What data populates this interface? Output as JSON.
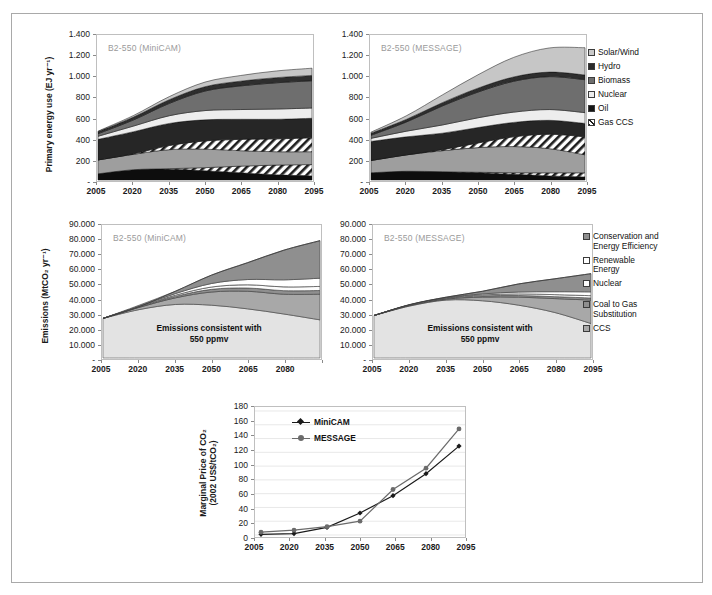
{
  "figure": {
    "panels": [
      {
        "id": "top-left",
        "tag": "B2-550 (MiniCAM)"
      },
      {
        "id": "top-right",
        "tag": "B2-550 (MESSAGE)"
      },
      {
        "id": "mid-left",
        "tag": "B2-550 (MiniCAM)"
      },
      {
        "id": "mid-right",
        "tag": "B2-550 (MESSAGE)"
      },
      {
        "id": "bottom",
        "tag": ""
      }
    ]
  },
  "energy_legend": {
    "items": [
      {
        "label": "Solar/Wind",
        "color": "#c9c9c9",
        "pattern": "solid"
      },
      {
        "label": "Hydro",
        "color": "#2b2b2b",
        "pattern": "solid"
      },
      {
        "label": "Biomass",
        "color": "#6e6e6e",
        "pattern": "solid"
      },
      {
        "label": "Nuclear",
        "color": "#ededed",
        "pattern": "solid"
      },
      {
        "label": "Oil",
        "color": "#151515",
        "pattern": "solid"
      },
      {
        "label": "Gas CCS",
        "color": "#ffffff",
        "pattern": "hatch"
      },
      {
        "label": "Coal CCS",
        "color": "#ffffff",
        "pattern": "hatch"
      }
    ]
  },
  "emissions_legend": {
    "items": [
      {
        "label": "Conservation and\nEnergy Efficiency",
        "color": "#8f8f8f",
        "pattern": "solid"
      },
      {
        "label": "Renewable\nEnergy",
        "color": "#ffffff",
        "pattern": "solid"
      },
      {
        "label": "Nuclear",
        "color": "#fcfcfc",
        "pattern": "solid"
      },
      {
        "label": "Coal to Gas\nSubstitution",
        "color": "#8f8f8f",
        "pattern": "solid"
      },
      {
        "label": "CCS",
        "color": "#a8a8a8",
        "pattern": "solid"
      }
    ]
  },
  "chart_data": [
    {
      "id": "top-left",
      "type": "area",
      "title": "B2-550 (MiniCAM)",
      "xlabel": "",
      "ylabel": "Primary energy use (EJ yr-1)",
      "ylabel_html": "Primary energy use (EJ yr&#8315;&#185;)",
      "x": [
        2005,
        2020,
        2035,
        2050,
        2065,
        2080,
        2095
      ],
      "xticklabels": [
        "2005",
        "2020",
        "2035",
        "2050",
        "2065",
        "2080",
        "2095"
      ],
      "yticklabels": [
        "1.400",
        "1.200",
        "1.000",
        "800",
        "600",
        "400",
        "200",
        "-"
      ],
      "ylim": [
        0,
        1400
      ],
      "ytickvalues": [
        1400,
        1200,
        1000,
        800,
        600,
        400,
        200,
        0
      ],
      "grid": false,
      "stack_order_bottom_to_top": [
        "Coal",
        "Coal CCS",
        "Gas",
        "Gas CCS",
        "Oil",
        "Nuclear",
        "Biomass",
        "Hydro",
        "Solar/Wind"
      ],
      "series": [
        {
          "name": "Coal",
          "color": "#0d0d0d",
          "pattern": "solid",
          "values": [
            60,
            100,
            105,
            90,
            70,
            50,
            40
          ]
        },
        {
          "name": "Coal CCS",
          "color": "#ffffff",
          "pattern": "hatch",
          "values": [
            0,
            0,
            5,
            30,
            65,
            95,
            110
          ]
        },
        {
          "name": "Gas",
          "color": "#9e9e9e",
          "pattern": "solid",
          "values": [
            135,
            150,
            185,
            180,
            150,
            130,
            125
          ]
        },
        {
          "name": "Gas CCS",
          "color": "#ffffff",
          "pattern": "hatch",
          "values": [
            0,
            5,
            40,
            80,
            110,
            125,
            135
          ]
        },
        {
          "name": "Oil",
          "color": "#262626",
          "pattern": "solid",
          "values": [
            200,
            215,
            215,
            205,
            195,
            190,
            190
          ]
        },
        {
          "name": "Nuclear",
          "color": "#ededed",
          "pattern": "solid",
          "values": [
            30,
            55,
            75,
            90,
            95,
            100,
            100
          ]
        },
        {
          "name": "Biomass",
          "color": "#6e6e6e",
          "pattern": "solid",
          "values": [
            25,
            60,
            120,
            190,
            230,
            255,
            265
          ]
        },
        {
          "name": "Hydro",
          "color": "#2e2e2e",
          "pattern": "solid",
          "values": [
            20,
            28,
            36,
            42,
            46,
            50,
            52
          ]
        },
        {
          "name": "Solar/Wind",
          "color": "#c6c6c6",
          "pattern": "solid",
          "values": [
            5,
            15,
            30,
            45,
            55,
            65,
            70
          ]
        }
      ],
      "totals": [
        475,
        628,
        811,
        912,
        1016,
        1060,
        1087
      ]
    },
    {
      "id": "top-right",
      "type": "area",
      "title": "B2-550 (MESSAGE)",
      "xlabel": "",
      "ylabel": "",
      "x": [
        2005,
        2020,
        2035,
        2050,
        2065,
        2080,
        2095
      ],
      "xticklabels": [
        "2005",
        "2020",
        "2035",
        "2050",
        "2065",
        "2080",
        "2095"
      ],
      "yticklabels": [
        "1.400",
        "1.200",
        "1.000",
        "800",
        "600",
        "400",
        "200",
        "-"
      ],
      "ylim": [
        0,
        1400
      ],
      "ytickvalues": [
        1400,
        1200,
        1000,
        800,
        600,
        400,
        200,
        0
      ],
      "grid": false,
      "stack_order_bottom_to_top": [
        "Coal",
        "Coal CCS",
        "Gas",
        "Gas CCS",
        "Oil",
        "Nuclear",
        "Biomass",
        "Hydro",
        "Solar/Wind"
      ],
      "series": [
        {
          "name": "Coal",
          "color": "#0d0d0d",
          "pattern": "solid",
          "values": [
            70,
            85,
            80,
            70,
            55,
            40,
            30
          ]
        },
        {
          "name": "Coal CCS",
          "color": "#ffffff",
          "pattern": "hatch",
          "values": [
            0,
            0,
            0,
            5,
            15,
            30,
            40
          ]
        },
        {
          "name": "Gas",
          "color": "#9e9e9e",
          "pattern": "solid",
          "values": [
            120,
            160,
            205,
            240,
            255,
            235,
            175
          ]
        },
        {
          "name": "Gas CCS",
          "color": "#ffffff",
          "pattern": "hatch",
          "values": [
            0,
            0,
            10,
            45,
            95,
            140,
            175
          ]
        },
        {
          "name": "Oil",
          "color": "#262626",
          "pattern": "solid",
          "values": [
            185,
            175,
            160,
            150,
            140,
            135,
            130
          ]
        },
        {
          "name": "Nuclear",
          "color": "#ededed",
          "pattern": "solid",
          "values": [
            30,
            55,
            80,
            95,
            100,
            105,
            105
          ]
        },
        {
          "name": "Biomass",
          "color": "#6e6e6e",
          "pattern": "solid",
          "values": [
            30,
            90,
            185,
            250,
            300,
            320,
            320
          ]
        },
        {
          "name": "Hydro",
          "color": "#2e2e2e",
          "pattern": "solid",
          "values": [
            20,
            26,
            32,
            38,
            42,
            44,
            46
          ]
        },
        {
          "name": "Solar/Wind",
          "color": "#c6c6c6",
          "pattern": "solid",
          "values": [
            10,
            35,
            75,
            130,
            190,
            235,
            265
          ]
        }
      ],
      "totals": [
        465,
        626,
        827,
        1023,
        1192,
        1284,
        1286
      ]
    },
    {
      "id": "mid-left",
      "type": "area",
      "title": "B2-550 (MiniCAM)",
      "xlabel": "",
      "ylabel": "Emissions (MtCO2 yr-1)",
      "ylabel_html": "Emissions (MtCO&#8322; yr&#8315;&#185;)",
      "x": [
        2005,
        2020,
        2035,
        2050,
        2065,
        2080,
        2095
      ],
      "xticklabels": [
        "2005",
        "2020",
        "2035",
        "2050",
        "2065",
        "2080",
        "2095"
      ],
      "yticklabels": [
        "90.000",
        "80.000",
        "70.000",
        "60.000",
        "50.000",
        "40.000",
        "30.000",
        "20.000",
        "10.000",
        "-"
      ],
      "ylim": [
        0,
        90000
      ],
      "ytickvalues": [
        90000,
        80000,
        70000,
        60000,
        50000,
        40000,
        30000,
        20000,
        10000,
        0
      ],
      "grid": false,
      "annotation": "Emissions consistent with\n550 ppmv",
      "baseline_name": "Emissions consistent with 550 ppmv",
      "baseline_values": [
        27000,
        33000,
        36500,
        36000,
        33500,
        30000,
        26000
      ],
      "reference_total": [
        27000,
        35000,
        45500,
        56500,
        65000,
        73500,
        80000
      ],
      "series": [
        {
          "name": "CCS",
          "color": "#a8a8a8",
          "pattern": "solid",
          "values": [
            0,
            1500,
            4500,
            9000,
            12000,
            13500,
            17500
          ]
        },
        {
          "name": "Coal to Gas Substitution",
          "color": "#8f8f8f",
          "pattern": "solid",
          "values": [
            0,
            300,
            1000,
            1800,
            2200,
            2400,
            2500
          ]
        },
        {
          "name": "Nuclear",
          "color": "#fcfcfc",
          "pattern": "solid",
          "values": [
            0,
            200,
            800,
            1600,
            2200,
            2600,
            2800
          ]
        },
        {
          "name": "Renewable Energy",
          "color": "#ffffff",
          "pattern": "solid",
          "values": [
            0,
            300,
            1100,
            2400,
            3600,
            4800,
            5600
          ]
        },
        {
          "name": "Conservation and Energy Efficiency",
          "color": "#8f8f8f",
          "pattern": "solid",
          "values": [
            0,
            700,
            1600,
            5700,
            11500,
            20200,
            25600
          ]
        }
      ]
    },
    {
      "id": "mid-right",
      "type": "area",
      "title": "B2-550 (MESSAGE)",
      "xlabel": "",
      "ylabel": "",
      "x": [
        2005,
        2020,
        2035,
        2050,
        2065,
        2080,
        2095
      ],
      "xticklabels": [
        "2005",
        "2020",
        "2035",
        "2050",
        "2065",
        "2080",
        "2095"
      ],
      "yticklabels": [
        "90.000",
        "80.000",
        "70.000",
        "60.000",
        "50.000",
        "40.000",
        "30.000",
        "20.000",
        "10.000",
        "-"
      ],
      "ylim": [
        0,
        90000
      ],
      "ytickvalues": [
        90000,
        80000,
        70000,
        60000,
        50000,
        40000,
        30000,
        20000,
        10000,
        0
      ],
      "grid": false,
      "annotation": "Emissions consistent with\n550 ppmv",
      "baseline_values": [
        29000,
        35500,
        39500,
        39000,
        36000,
        31000,
        23500
      ],
      "reference_total": [
        29000,
        36500,
        41500,
        45500,
        50500,
        54000,
        57500
      ],
      "series": [
        {
          "name": "CCS",
          "color": "#a8a8a8",
          "pattern": "solid",
          "values": [
            0,
            400,
            600,
            2500,
            5500,
            9500,
            16000
          ]
        },
        {
          "name": "Coal to Gas Substitution",
          "color": "#8f8f8f",
          "pattern": "solid",
          "values": [
            0,
            200,
            400,
            800,
            1100,
            1300,
            1400
          ]
        },
        {
          "name": "Nuclear",
          "color": "#fcfcfc",
          "pattern": "solid",
          "values": [
            0,
            100,
            300,
            700,
            1100,
            1400,
            1600
          ]
        },
        {
          "name": "Renewable Energy",
          "color": "#ffffff",
          "pattern": "solid",
          "values": [
            0,
            100,
            300,
            700,
            1300,
            2000,
            2600
          ]
        },
        {
          "name": "Conservation and Energy Efficiency",
          "color": "#8f8f8f",
          "pattern": "solid",
          "values": [
            0,
            200,
            400,
            1800,
            5500,
            8800,
            12400
          ]
        }
      ]
    },
    {
      "id": "bottom",
      "type": "line",
      "title": "",
      "xlabel": "",
      "ylabel": "Marginal Price of CO2 (2002 US$/tCO2)",
      "ylabel_line1": "Marginal Price of CO₂",
      "ylabel_line2": "(2002 US$/tCO₂)",
      "x": [
        2005,
        2020,
        2035,
        2050,
        2065,
        2080,
        2095
      ],
      "xticklabels": [
        "2005",
        "2020",
        "2035",
        "2050",
        "2065",
        "2080",
        "2095"
      ],
      "yticklabels": [
        "180",
        "160",
        "140",
        "120",
        "100",
        "80",
        "60",
        "40",
        "20",
        "0"
      ],
      "ylim": [
        0,
        180
      ],
      "ytickvalues": [
        180,
        160,
        140,
        120,
        100,
        80,
        60,
        40,
        20,
        0
      ],
      "grid": true,
      "legend_position": "upper-left-inside",
      "series": [
        {
          "name": "MiniCAM",
          "color": "#1a1a1a",
          "marker": "diamond",
          "values": [
            1,
            2,
            11,
            32,
            57,
            89,
            129
          ]
        },
        {
          "name": "MESSAGE",
          "color": "#6b6b6b",
          "marker": "circle",
          "values": [
            4,
            7,
            12,
            20,
            66,
            97,
            154
          ]
        }
      ]
    }
  ]
}
